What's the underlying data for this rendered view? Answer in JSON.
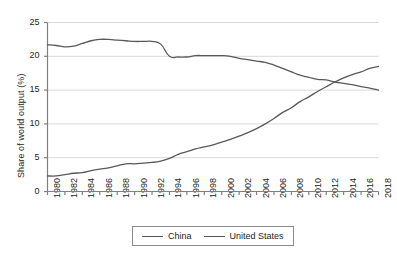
{
  "chart_data": {
    "type": "line",
    "title": "",
    "xlabel": "",
    "ylabel": "Share of world output (%)",
    "ylim": [
      0,
      25
    ],
    "yticks": [
      0,
      5,
      10,
      15,
      20,
      25
    ],
    "xlim": [
      1980,
      2018
    ],
    "grid": "horizontal",
    "legend_position": "bottom-center",
    "x": [
      1980,
      1981,
      1982,
      1983,
      1984,
      1985,
      1986,
      1987,
      1988,
      1989,
      1990,
      1991,
      1992,
      1993,
      1994,
      1995,
      1996,
      1997,
      1998,
      1999,
      2000,
      2001,
      2002,
      2003,
      2004,
      2005,
      2006,
      2007,
      2008,
      2009,
      2010,
      2011,
      2012,
      2013,
      2014,
      2015,
      2016,
      2017,
      2018
    ],
    "xtick_labels": [
      "1980",
      "1982",
      "1984",
      "1986",
      "1988",
      "1990",
      "1992",
      "1994",
      "1996",
      "1998",
      "2000",
      "2002",
      "2004",
      "2006",
      "2008",
      "2010",
      "2012",
      "2014",
      "2016",
      "2018"
    ],
    "series": [
      {
        "name": "China",
        "color": "#595959",
        "values": [
          2.3,
          2.3,
          2.5,
          2.7,
          2.8,
          3.1,
          3.3,
          3.5,
          3.8,
          4.1,
          4.1,
          4.2,
          4.3,
          4.5,
          4.9,
          5.5,
          5.9,
          6.3,
          6.6,
          6.9,
          7.3,
          7.7,
          8.2,
          8.7,
          9.3,
          10.0,
          10.8,
          11.7,
          12.4,
          13.3,
          14.0,
          14.8,
          15.5,
          16.2,
          16.8,
          17.3,
          17.7,
          18.2,
          18.5
        ]
      },
      {
        "name": "United States",
        "color": "#595959",
        "values": [
          21.7,
          21.6,
          21.4,
          21.5,
          21.9,
          22.3,
          22.5,
          22.5,
          22.4,
          22.3,
          22.2,
          22.2,
          22.2,
          21.8,
          20.0,
          19.9,
          19.9,
          20.1,
          20.1,
          20.1,
          20.1,
          20.0,
          19.7,
          19.5,
          19.3,
          19.1,
          18.7,
          18.2,
          17.7,
          17.2,
          16.9,
          16.6,
          16.5,
          16.2,
          16.0,
          15.8,
          15.5,
          15.3,
          15.0
        ]
      }
    ]
  },
  "legend": {
    "entries": [
      {
        "label": "China"
      },
      {
        "label": "United States"
      }
    ]
  }
}
